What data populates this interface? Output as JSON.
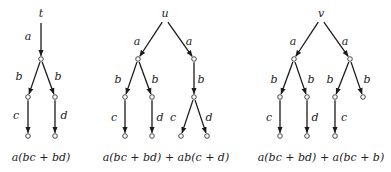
{
  "trees": [
    {
      "root_label": "t",
      "caption": "a(bc + bd)",
      "nodes": [
        [
          41,
          18
        ],
        [
          41,
          59
        ],
        [
          28,
          97
        ],
        [
          55,
          97
        ],
        [
          28,
          136
        ],
        [
          55,
          136
        ]
      ],
      "edges": [
        {
          "from": 0,
          "to": 1,
          "label": "a",
          "lx": 28,
          "ly": 40
        },
        {
          "from": 1,
          "to": 2,
          "label": "b",
          "lx": 19,
          "ly": 80
        },
        {
          "from": 1,
          "to": 3,
          "label": "b",
          "lx": 58,
          "ly": 80
        },
        {
          "from": 2,
          "to": 4,
          "label": "c",
          "lx": 16,
          "ly": 119
        },
        {
          "from": 3,
          "to": 5,
          "label": "d",
          "lx": 64,
          "ly": 119
        }
      ],
      "caption_x": 41
    },
    {
      "root_label": "u",
      "caption": "a(bc + bd) + ab(c + d)",
      "nodes": [
        [
          165,
          18
        ],
        [
          138,
          59
        ],
        [
          194,
          59
        ],
        [
          125,
          97
        ],
        [
          152,
          97
        ],
        [
          194,
          97
        ],
        [
          125,
          136
        ],
        [
          152,
          136
        ],
        [
          181,
          136
        ],
        [
          207,
          136
        ]
      ],
      "edges": [
        {
          "from": 0,
          "to": 1,
          "label": "a",
          "lx": 137,
          "ly": 45
        },
        {
          "from": 0,
          "to": 2,
          "label": "a",
          "lx": 189,
          "ly": 45
        },
        {
          "from": 1,
          "to": 3,
          "label": "b",
          "lx": 118,
          "ly": 83
        },
        {
          "from": 1,
          "to": 4,
          "label": "b",
          "lx": 155,
          "ly": 83
        },
        {
          "from": 2,
          "to": 5,
          "label": "b",
          "lx": 201,
          "ly": 83
        },
        {
          "from": 3,
          "to": 6,
          "label": "c",
          "lx": 114,
          "ly": 121
        },
        {
          "from": 4,
          "to": 7,
          "label": "d",
          "lx": 160,
          "ly": 121
        },
        {
          "from": 5,
          "to": 8,
          "label": "c",
          "lx": 173,
          "ly": 121
        },
        {
          "from": 5,
          "to": 9,
          "label": "d",
          "lx": 209,
          "ly": 121
        }
      ],
      "caption_x": 166
    },
    {
      "root_label": "v",
      "caption": "a(bc + bd) + a(bc + b)",
      "nodes": [
        [
          321,
          18
        ],
        [
          294,
          59
        ],
        [
          350,
          59
        ],
        [
          280,
          97
        ],
        [
          307,
          97
        ],
        [
          335,
          97
        ],
        [
          363,
          97
        ],
        [
          280,
          136
        ],
        [
          307,
          136
        ],
        [
          335,
          136
        ]
      ],
      "edges": [
        {
          "from": 0,
          "to": 1,
          "label": "a",
          "lx": 293,
          "ly": 45
        },
        {
          "from": 0,
          "to": 2,
          "label": "a",
          "lx": 345,
          "ly": 45
        },
        {
          "from": 1,
          "to": 3,
          "label": "b",
          "lx": 274,
          "ly": 83
        },
        {
          "from": 1,
          "to": 4,
          "label": "b",
          "lx": 311,
          "ly": 83
        },
        {
          "from": 2,
          "to": 5,
          "label": "b",
          "lx": 330,
          "ly": 83
        },
        {
          "from": 2,
          "to": 6,
          "label": "b",
          "lx": 367,
          "ly": 83
        },
        {
          "from": 3,
          "to": 7,
          "label": "c",
          "lx": 269,
          "ly": 121
        },
        {
          "from": 4,
          "to": 8,
          "label": "d",
          "lx": 315,
          "ly": 121
        },
        {
          "from": 5,
          "to": 9,
          "label": "c",
          "lx": 344,
          "ly": 121
        }
      ],
      "caption_x": 321
    }
  ],
  "caption_y": 161,
  "colors": {
    "edge": "#1a1a1a",
    "node_stroke": "#333333",
    "text": "#222222"
  }
}
